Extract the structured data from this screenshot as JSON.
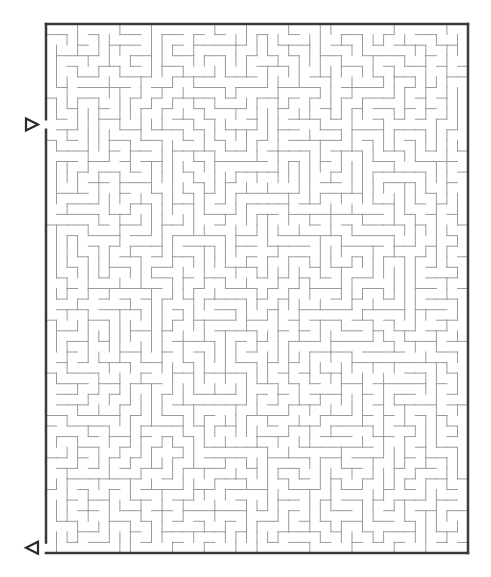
{
  "maze": {
    "cols": 40,
    "rows": 50,
    "origin_x": 46,
    "origin_y": 24,
    "cell_w": 10.55,
    "cell_h": 10.58,
    "seed": 1337,
    "wall_color": "#9a9a9a",
    "border_color": "#3a3a3a",
    "entrance": {
      "side": "left",
      "row": 9,
      "marker": "right-triangle-icon"
    },
    "exit": {
      "side": "bottom-left",
      "row": 49,
      "marker": "left-triangle-icon"
    }
  }
}
